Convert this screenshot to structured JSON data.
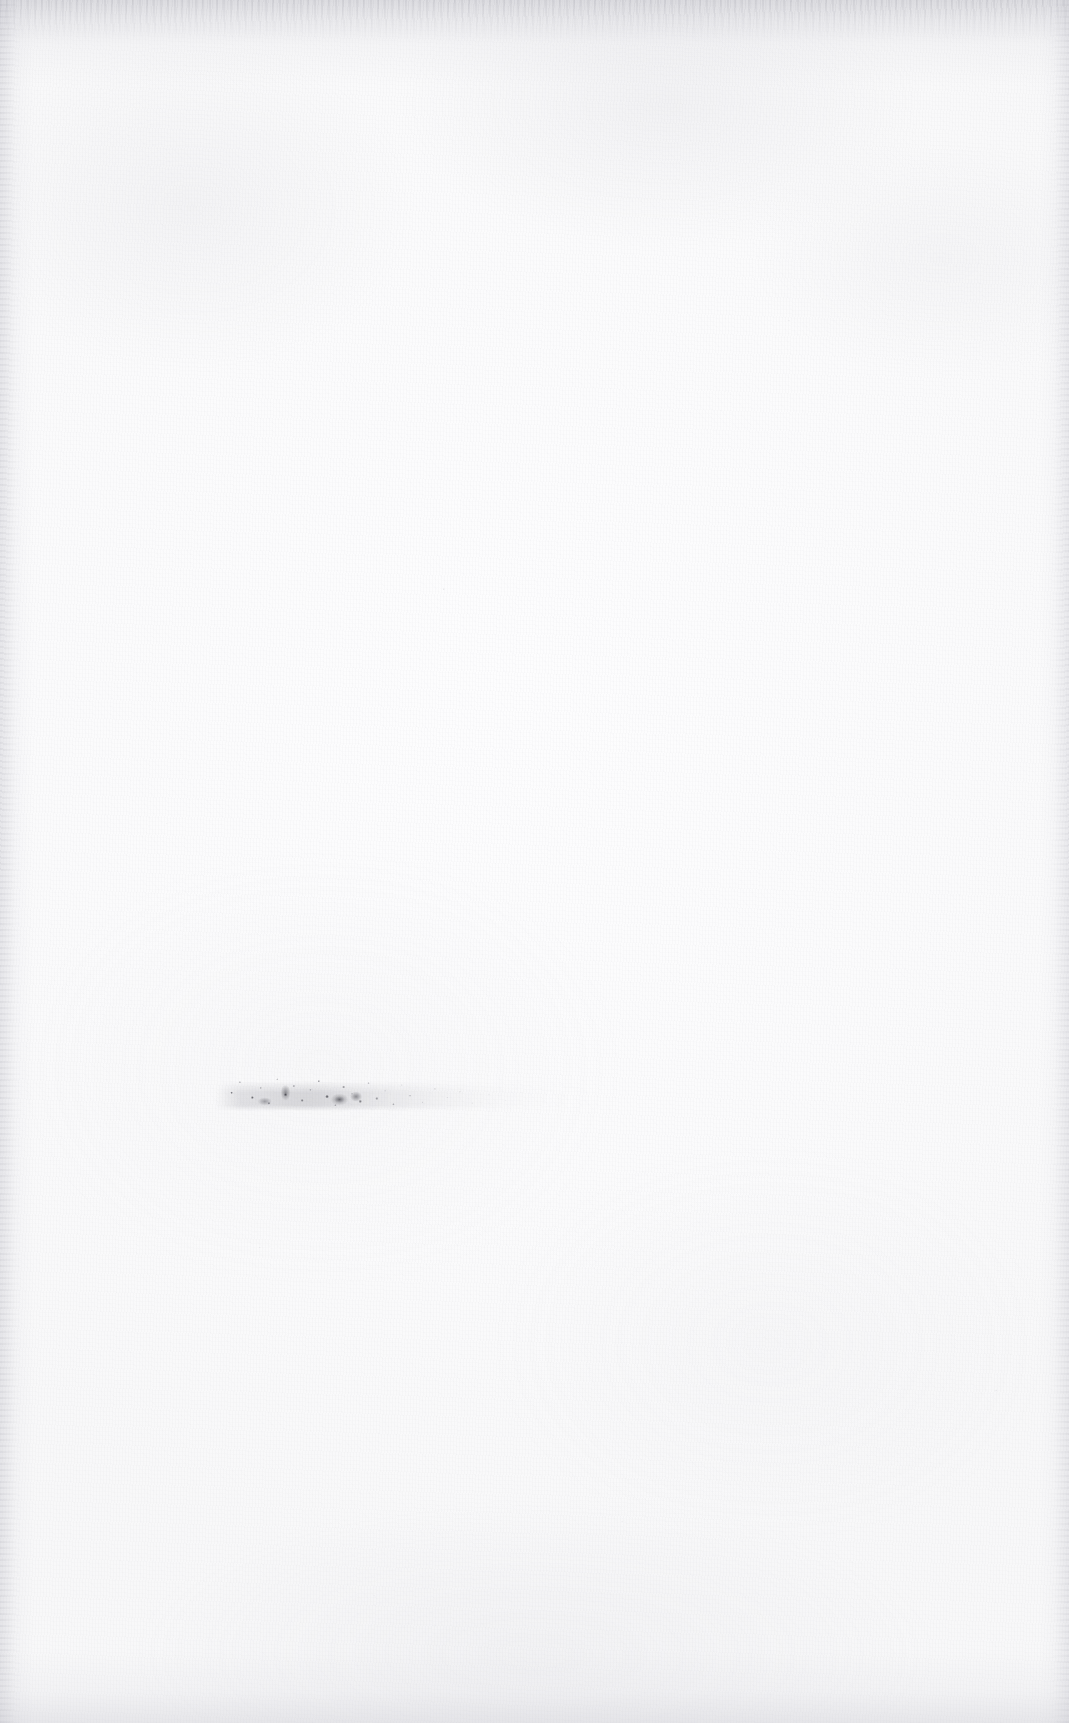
{
  "document": {
    "kind": "scanned-blank-page",
    "orientation": "portrait",
    "page_width_px": 1069,
    "page_height_px": 1723,
    "paper_color": "#fbfbfc",
    "paper_highlight_color": "#fdfdfe",
    "paper_shadow_color": "#f6f6f8",
    "ink_color": "#4a4a52",
    "description": "A scanned, essentially blank sheet of off-white paper with fine fibre grain, darker mottled shading along the top edge and faint grain along the left, right and bottom edges."
  },
  "content": {
    "has_headings": false,
    "has_rules": false,
    "has_figures": false,
    "has_page_number": false,
    "text_blocks": [
      {
        "name": "faded-degraded-line",
        "legible": false,
        "transcription": "",
        "note": "Single short line of severely faded, broken marks; individual glyphs are not legible.",
        "lines": 1,
        "left_px": 215,
        "top_px": 1063,
        "width_px": 415,
        "height_px": 48,
        "ink_color": "#4a4a52",
        "density": "dense at left, dissolving to sparse specks at right"
      }
    ]
  },
  "scan_artifacts": {
    "top_edge_shading": true,
    "bottom_edge_shading": true,
    "left_edge_shading": true,
    "right_edge_shading": true,
    "paper_grain": true,
    "stray_specks": true
  }
}
